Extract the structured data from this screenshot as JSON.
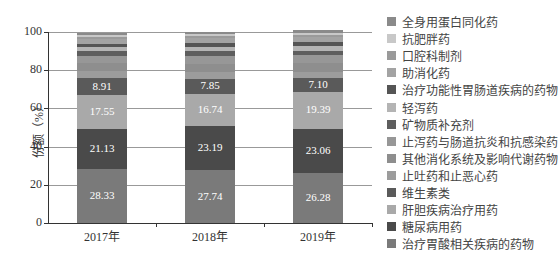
{
  "chart_data": {
    "type": "bar",
    "stacked": true,
    "title": "",
    "xlabel": "",
    "ylabel": "份额（%）",
    "ylim": [
      0,
      100
    ],
    "yticks": [
      "0",
      "20",
      "40",
      "60",
      "80",
      "100"
    ],
    "grid": true,
    "legend_position": "right",
    "categories": [
      "2017年",
      "2018年",
      "2019年"
    ],
    "series": [
      {
        "name": "治疗胃酸相关疾病的药物",
        "color": "#7a7a7a",
        "values": [
          28.33,
          27.74,
          26.28
        ],
        "labeled": true
      },
      {
        "name": "糖尿病用药",
        "color": "#4a4a4a",
        "values": [
          21.13,
          23.19,
          23.06
        ],
        "labeled": true
      },
      {
        "name": "肝胆疾病治疗用药",
        "color": "#a9a9a9",
        "values": [
          17.55,
          16.74,
          19.39
        ],
        "labeled": true
      },
      {
        "name": "维生素类",
        "color": "#5a5a5a",
        "values": [
          8.91,
          7.85,
          7.1
        ],
        "labeled": true
      },
      {
        "name": "止吐药和止恶心药",
        "color": "#9c9c9c",
        "values": [
          3.5,
          3.6,
          3.4
        ],
        "labeled": false
      },
      {
        "name": "其他消化系统及影响代谢药物",
        "color": "#8e8e8e",
        "values": [
          4.2,
          4.3,
          4.5
        ],
        "labeled": false
      },
      {
        "name": "止泻药与肠道抗炎和抗感染药",
        "color": "#979797",
        "values": [
          4.0,
          4.1,
          4.0
        ],
        "labeled": false
      },
      {
        "name": "矿物质补充剂",
        "color": "#5e5e5e",
        "values": [
          2.2,
          2.3,
          2.4
        ],
        "labeled": false
      },
      {
        "name": "轻泻药",
        "color": "#b4b4b4",
        "values": [
          2.4,
          2.5,
          2.6
        ],
        "labeled": false
      },
      {
        "name": "治疗功能性胃肠道疾病的药物",
        "color": "#555555",
        "values": [
          1.6,
          1.7,
          1.8
        ],
        "labeled": false
      },
      {
        "name": "助消化药",
        "color": "#a3a3a3",
        "values": [
          2.6,
          2.7,
          2.8
        ],
        "labeled": false
      },
      {
        "name": "口腔科制剂",
        "color": "#9a9a9a",
        "values": [
          1.2,
          1.2,
          1.2
        ],
        "labeled": false
      },
      {
        "name": "抗肥胖药",
        "color": "#c8c8c8",
        "values": [
          0.9,
          0.9,
          0.8
        ],
        "labeled": false
      },
      {
        "name": "全身用蛋白同化药",
        "color": "#8a8a8a",
        "values": [
          1.08,
          1.17,
          1.66
        ],
        "labeled": false
      }
    ]
  },
  "legend": {
    "items": [
      {
        "label": "全身用蛋白同化药",
        "color": "#8a8a8a"
      },
      {
        "label": "抗肥胖药",
        "color": "#c8c8c8"
      },
      {
        "label": "口腔科制剂",
        "color": "#9a9a9a"
      },
      {
        "label": "助消化药",
        "color": "#a3a3a3"
      },
      {
        "label": "治疗功能性胃肠道疾病的药物",
        "color": "#555555"
      },
      {
        "label": "轻泻药",
        "color": "#b4b4b4"
      },
      {
        "label": "矿物质补充剂",
        "color": "#5e5e5e"
      },
      {
        "label": "止泻药与肠道抗炎和抗感染药",
        "color": "#979797"
      },
      {
        "label": "其他消化系统及影响代谢药物",
        "color": "#8e8e8e"
      },
      {
        "label": "止吐药和止恶心药",
        "color": "#9c9c9c"
      },
      {
        "label": "维生素类",
        "color": "#5a5a5a"
      },
      {
        "label": "肝胆疾病治疗用药",
        "color": "#a9a9a9"
      },
      {
        "label": "糖尿病用药",
        "color": "#4a4a4a"
      },
      {
        "label": "治疗胃酸相关疾病的药物",
        "color": "#7a7a7a"
      }
    ]
  }
}
